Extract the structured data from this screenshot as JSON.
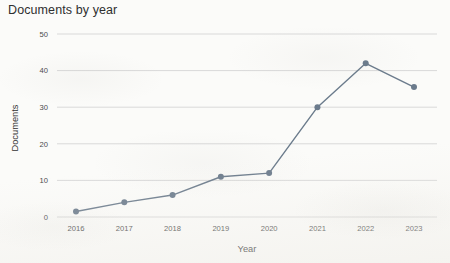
{
  "chart_data": {
    "type": "line",
    "title": "Documents by year",
    "xlabel": "Year",
    "ylabel": "Documents",
    "categories": [
      "2016",
      "2017",
      "2018",
      "2019",
      "2020",
      "2021",
      "2022",
      "2023"
    ],
    "values": [
      1.5,
      4,
      6,
      11,
      12,
      30,
      42,
      35.5
    ],
    "series": [
      {
        "name": "Documents",
        "values": [
          1.5,
          4,
          6,
          11,
          12,
          30,
          42,
          35.5
        ]
      }
    ],
    "x": [
      2016,
      2017,
      2018,
      2019,
      2020,
      2021,
      2022,
      2023
    ],
    "ylim": [
      0,
      50
    ],
    "yticks": [
      "0",
      "10",
      "20",
      "30",
      "40",
      "50"
    ],
    "ytick_values": [
      0,
      10,
      20,
      30,
      40,
      50
    ],
    "xticks": [
      "2016",
      "2017",
      "2018",
      "2019",
      "2020",
      "2021",
      "2022",
      "2023"
    ],
    "grid": "horizontal",
    "legend": "none",
    "line_color": "#6b7b8c",
    "marker_color": "#6b7b8c",
    "grid_color": "#d9d9d9",
    "background_color": "#fbfbf9",
    "marker": "circle",
    "line_width": 1.4,
    "marker_size": 3
  }
}
